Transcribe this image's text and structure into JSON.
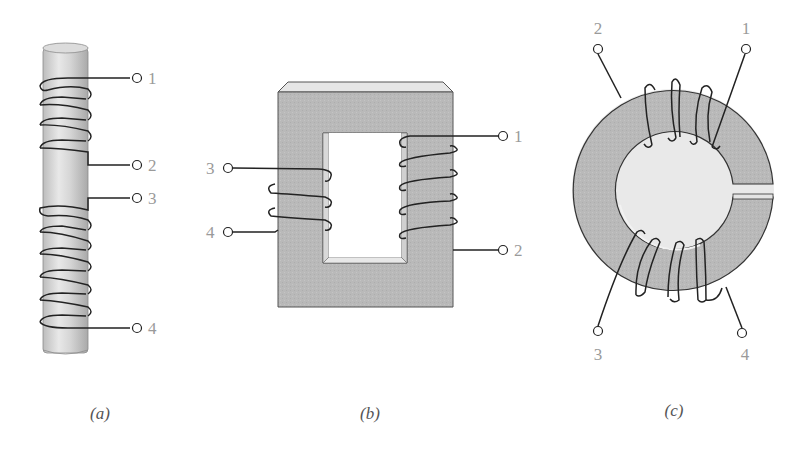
{
  "figure": {
    "panels": [
      {
        "id": "a",
        "caption": "(a)",
        "description": "Tapped solenoid winding on a cylindrical rod core",
        "core": "cylindrical rod",
        "terminals": [
          "1",
          "2",
          "3",
          "4"
        ],
        "winding_groups": [
          {
            "from": "1",
            "to": "2",
            "turns": 4
          },
          {
            "from": "3",
            "to": "4",
            "turns": 6
          }
        ]
      },
      {
        "id": "b",
        "caption": "(b)",
        "description": "Two windings on a rectangular (shell) core",
        "core": "rectangular core with window",
        "terminals": [
          "1",
          "2",
          "3",
          "4"
        ],
        "winding_groups": [
          {
            "from": "3",
            "to": "4",
            "turns": 3,
            "leg": "left"
          },
          {
            "from": "1",
            "to": "2",
            "turns": 5,
            "leg": "right"
          }
        ]
      },
      {
        "id": "c",
        "caption": "(c)",
        "description": "Two windings on a gapped toroidal core",
        "core": "toroid with air gap",
        "terminals": [
          "1",
          "2",
          "3",
          "4"
        ],
        "winding_groups": [
          {
            "from": "2",
            "to": "1",
            "turns": 4,
            "position": "top"
          },
          {
            "from": "3",
            "to": "4",
            "turns": 4,
            "position": "bottom"
          }
        ]
      }
    ]
  },
  "colors": {
    "core_fill": "#b8b8b8",
    "core_light": "#e2e2e2",
    "wire": "#222222",
    "label": "#9a9a9a"
  }
}
